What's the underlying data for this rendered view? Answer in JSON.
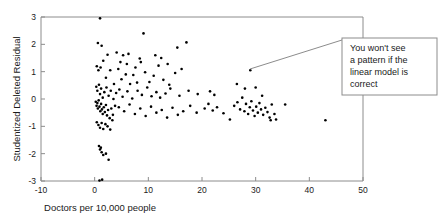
{
  "chart_data": {
    "type": "scatter",
    "title": "",
    "xlabel": "Doctors per 10,000 people",
    "ylabel": "Studentized Deleted Residual",
    "xlim": [
      -10,
      50
    ],
    "ylim": [
      -3,
      3
    ],
    "xticks": [
      -10,
      0,
      10,
      20,
      30,
      40,
      50
    ],
    "xtick_labels": [
      "-10",
      "0",
      "10",
      "20",
      "30",
      "40",
      "50"
    ],
    "yticks": [
      -3,
      -2,
      -1,
      0,
      1,
      2,
      3
    ],
    "ytick_labels": [
      "-3",
      "-2",
      "-1",
      "0",
      "1",
      "2",
      "3"
    ],
    "grid": false,
    "legend": null,
    "marker": "filled-circle",
    "marker_color": "#000000",
    "points": [
      [
        1.0,
        2.95
      ],
      [
        0.6,
        2.05
      ],
      [
        1.3,
        1.95
      ],
      [
        2.4,
        1.62
      ],
      [
        4.1,
        1.7
      ],
      [
        5.3,
        1.6
      ],
      [
        6.3,
        1.65
      ],
      [
        8.4,
        1.48
      ],
      [
        9.1,
        2.4
      ],
      [
        11.3,
        1.6
      ],
      [
        12.4,
        1.5
      ],
      [
        13.6,
        1.28
      ],
      [
        15.4,
        1.88
      ],
      [
        17.1,
        2.07
      ],
      [
        0.4,
        1.2
      ],
      [
        0.7,
        1.05
      ],
      [
        1.1,
        1.15
      ],
      [
        1.6,
        1.4
      ],
      [
        2.1,
        0.78
      ],
      [
        2.9,
        1.05
      ],
      [
        3.6,
        0.55
      ],
      [
        4.4,
        1.1
      ],
      [
        5.0,
        0.72
      ],
      [
        5.8,
        0.9
      ],
      [
        6.6,
        0.55
      ],
      [
        7.2,
        0.88
      ],
      [
        7.9,
        0.6
      ],
      [
        8.6,
        1.35
      ],
      [
        9.4,
        0.98
      ],
      [
        10.2,
        0.62
      ],
      [
        11.0,
        0.85
      ],
      [
        11.9,
        1.22
      ],
      [
        12.8,
        0.7
      ],
      [
        13.9,
        0.52
      ],
      [
        15.0,
        0.95
      ],
      [
        16.2,
        1.1
      ],
      [
        4.8,
        1.35
      ],
      [
        6.0,
        1.28
      ],
      [
        7.6,
        1.15
      ],
      [
        0.3,
        0.45
      ],
      [
        0.5,
        0.3
      ],
      [
        0.8,
        0.52
      ],
      [
        1.0,
        0.18
      ],
      [
        1.2,
        0.38
      ],
      [
        1.5,
        0.05
      ],
      [
        1.8,
        0.25
      ],
      [
        2.2,
        0.42
      ],
      [
        2.6,
        0.12
      ],
      [
        3.0,
        0.3
      ],
      [
        3.5,
        0.0
      ],
      [
        4.0,
        0.22
      ],
      [
        4.6,
        0.35
      ],
      [
        5.2,
        0.08
      ],
      [
        6.1,
        0.28
      ],
      [
        7.0,
        0.02
      ],
      [
        8.0,
        0.3
      ],
      [
        8.8,
        0.15
      ],
      [
        9.8,
        0.42
      ],
      [
        10.6,
        0.1
      ],
      [
        11.5,
        0.25
      ],
      [
        12.2,
        0.05
      ],
      [
        13.2,
        0.2
      ],
      [
        14.1,
        0.38
      ],
      [
        15.8,
        0.12
      ],
      [
        17.5,
        0.3
      ],
      [
        19.2,
        0.18
      ],
      [
        0.2,
        -0.1
      ],
      [
        0.35,
        -0.25
      ],
      [
        0.5,
        -0.15
      ],
      [
        0.6,
        -0.35
      ],
      [
        0.75,
        -0.05
      ],
      [
        0.9,
        -0.28
      ],
      [
        1.05,
        -0.45
      ],
      [
        1.2,
        -0.18
      ],
      [
        1.35,
        -0.38
      ],
      [
        1.5,
        -0.55
      ],
      [
        1.7,
        -0.3
      ],
      [
        1.9,
        -0.48
      ],
      [
        2.1,
        -0.22
      ],
      [
        2.3,
        -0.6
      ],
      [
        2.5,
        -0.4
      ],
      [
        2.8,
        -0.7
      ],
      [
        3.1,
        -0.35
      ],
      [
        3.4,
        -0.58
      ],
      [
        3.8,
        -0.25
      ],
      [
        0.4,
        -0.85
      ],
      [
        0.7,
        -0.95
      ],
      [
        1.0,
        -1.05
      ],
      [
        1.3,
        -0.88
      ],
      [
        1.6,
        -1.1
      ],
      [
        2.0,
        -0.92
      ],
      [
        2.4,
        -1.0
      ],
      [
        2.9,
        -1.12
      ],
      [
        3.3,
        -0.78
      ],
      [
        0.8,
        -1.72
      ],
      [
        1.0,
        -1.85
      ],
      [
        1.15,
        -1.78
      ],
      [
        1.3,
        -1.95
      ],
      [
        1.6,
        -2.05
      ],
      [
        2.1,
        -2.0
      ],
      [
        2.6,
        -2.22
      ],
      [
        0.9,
        -2.98
      ],
      [
        1.4,
        -2.95
      ],
      [
        4.5,
        -0.3
      ],
      [
        5.5,
        -0.45
      ],
      [
        6.5,
        -0.2
      ],
      [
        7.5,
        -0.55
      ],
      [
        8.5,
        -0.35
      ],
      [
        9.5,
        -0.62
      ],
      [
        10.5,
        -0.28
      ],
      [
        11.5,
        -0.5
      ],
      [
        12.5,
        -0.4
      ],
      [
        13.5,
        -0.68
      ],
      [
        14.5,
        -0.32
      ],
      [
        15.5,
        -0.58
      ],
      [
        16.5,
        -0.45
      ],
      [
        17.8,
        -0.25
      ],
      [
        19.0,
        -0.5
      ],
      [
        20.5,
        -0.35
      ],
      [
        21.2,
        -0.18
      ],
      [
        22.0,
        -0.42
      ],
      [
        22.8,
        -0.3
      ],
      [
        21.5,
        0.28
      ],
      [
        22.3,
        0.15
      ],
      [
        24.0,
        -0.52
      ],
      [
        25.2,
        -0.75
      ],
      [
        26.0,
        -0.25
      ],
      [
        26.6,
        -0.12
      ],
      [
        27.1,
        -0.38
      ],
      [
        27.5,
        0.05
      ],
      [
        27.9,
        -0.45
      ],
      [
        28.2,
        -0.18
      ],
      [
        28.6,
        -0.55
      ],
      [
        28.9,
        -0.3
      ],
      [
        29.2,
        -0.08
      ],
      [
        29.5,
        -0.42
      ],
      [
        29.8,
        -0.62
      ],
      [
        30.1,
        -0.28
      ],
      [
        30.4,
        -0.5
      ],
      [
        30.7,
        -0.15
      ],
      [
        31.0,
        -0.38
      ],
      [
        31.4,
        -0.58
      ],
      [
        31.8,
        -0.32
      ],
      [
        32.2,
        -0.48
      ],
      [
        32.6,
        -0.68
      ],
      [
        33.0,
        -0.2
      ],
      [
        33.5,
        -0.55
      ],
      [
        30.0,
        0.42
      ],
      [
        28.0,
        0.38
      ],
      [
        26.5,
        0.55
      ],
      [
        31.2,
        0.12
      ],
      [
        32.8,
        -0.78
      ],
      [
        33.8,
        -0.75
      ],
      [
        29.0,
        1.05
      ],
      [
        35.5,
        -0.2
      ],
      [
        43.0,
        -0.78
      ]
    ],
    "annotation": {
      "text": "You won't see a pattern if the linear model is correct",
      "lines": [
        "You won't see",
        "a pattern if the",
        "linear model is",
        "correct"
      ]
    }
  }
}
